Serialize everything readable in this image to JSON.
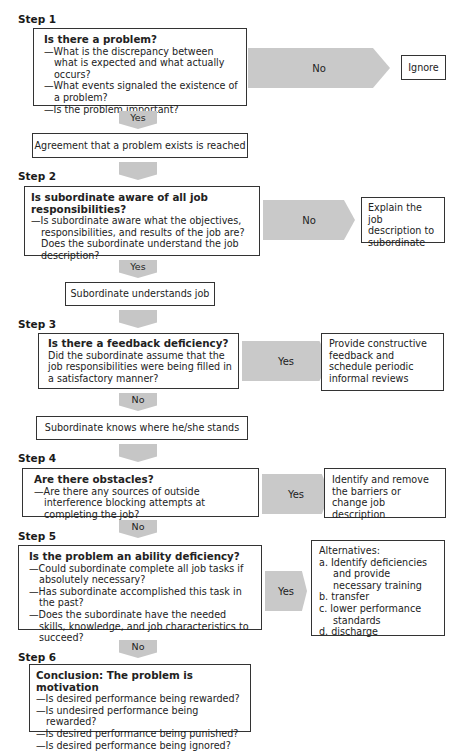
{
  "steps": [
    {
      "label": "Step 1",
      "question": {
        "title": "Is there a problem?",
        "lines": [
          "—What is the discrepancy between what is expected and what actually occurs?",
          "—What events signaled the existence of a problem?",
          "—Is the problem important?"
        ]
      },
      "side_arrow": "No",
      "side_outcome": "Ignore",
      "down_arrow": "Yes",
      "result": "Agreement that a problem exists is reached"
    },
    {
      "label": "Step 2",
      "question": {
        "title": "Is subordinate aware of all job responsibilities?",
        "lines": [
          "—Is subordinate aware what the objectives, responsibilities, and results of the job are? Does the subordinate understand the job description?"
        ]
      },
      "side_arrow": "No",
      "side_outcome": "Explain the job description to subordinate",
      "down_arrow": "Yes",
      "result": "Subordinate understands job"
    },
    {
      "label": "Step 3",
      "question": {
        "title": "Is there a feedback deficiency?",
        "lines": [
          "Did the subordinate assume that the job responsibilities were being filled in a satisfactory manner?"
        ]
      },
      "side_arrow": "Yes",
      "side_outcome": "Provide constructive feedback and schedule periodic informal reviews",
      "down_arrow": "No",
      "result": "Subordinate knows where he/she stands"
    },
    {
      "label": "Step 4",
      "question": {
        "title": "Are there obstacles?",
        "lines": [
          "—Are there any sources of outside interference blocking attempts at completing the job?"
        ]
      },
      "side_arrow": "Yes",
      "side_outcome": "Identify and remove the barriers or change job description",
      "down_arrow": "No"
    },
    {
      "label": "Step 5",
      "question": {
        "title": "Is the problem an ability deficiency?",
        "lines": [
          "—Could subordinate complete all job tasks if absolutely necessary?",
          "—Has subordinate accomplished this task in the past?",
          "—Does the subordinate have the needed skills, knowledge, and job characteristics to succeed?"
        ]
      },
      "side_arrow": "Yes",
      "side_outcome": {
        "heading": "Alternatives:",
        "items": [
          "a.  Identify deficiencies and provide necessary training",
          "b.  transfer",
          "c.  lower performance standards",
          "d.  discharge"
        ]
      },
      "down_arrow": "No"
    },
    {
      "label": "Step 6",
      "question": {
        "title": "Conclusion: The problem is motivation",
        "lines": [
          "—Is desired performance being rewarded?",
          "—Is undesired performance being rewarded?",
          "—Is desired performance being punished?",
          "—Is desired performance being ignored?"
        ]
      }
    }
  ],
  "colors": {
    "arrow_fill": "#c6c6c6",
    "border": "#333333"
  }
}
